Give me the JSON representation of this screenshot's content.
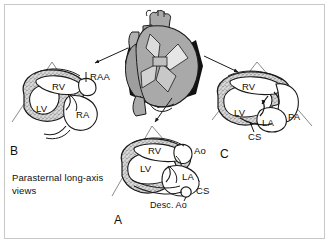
{
  "figure": {
    "title": "Parasternal long-axis views",
    "caption": "Parasternal long-axis views",
    "caption_line1": "Parasternal long-axis",
    "caption_line2": "views",
    "colors": {
      "background": "#ffffff",
      "frame": "#c9c9c9",
      "ink": "#0f0f0f",
      "myocardium_fill": "#b5b5b5",
      "sector_line": "#8a8a8a",
      "plane_black": "#111111",
      "heart_gray": "#a9a9a9",
      "heart_gray_dark": "#8f8f8f"
    }
  },
  "central_heart": {
    "name": "three-dimensional heart with imaging planes",
    "description": "Anterior view of the heart with three black fan-shaped tomographic planes transecting it",
    "planes": [
      {
        "name": "plane-to-panel-B",
        "target": "B"
      },
      {
        "name": "plane-to-panel-A",
        "target": "A"
      },
      {
        "name": "plane-to-panel-C",
        "target": "C"
      }
    ]
  },
  "arrows": [
    {
      "name": "arrow-to-panel-B",
      "from": "central heart",
      "to": "panel B sector"
    },
    {
      "name": "arrow-to-panel-A",
      "from": "central heart",
      "to": "panel A sector"
    },
    {
      "name": "arrow-to-panel-C",
      "from": "central heart",
      "to": "panel C sector"
    }
  ],
  "panels": [
    {
      "id": "A",
      "letter": "A",
      "name": "panel-a-standard-parasternal-long-axis",
      "labels": [
        {
          "key": "rv",
          "text": "RV",
          "kind": "chamber"
        },
        {
          "key": "lv",
          "text": "LV",
          "kind": "chamber"
        },
        {
          "key": "la",
          "text": "LA",
          "kind": "chamber"
        },
        {
          "key": "ao",
          "text": "Ao",
          "kind": "vessel"
        },
        {
          "key": "cs",
          "text": "CS",
          "kind": "vessel"
        },
        {
          "key": "desc_ao",
          "text": "Desc. Ao",
          "kind": "vessel"
        }
      ]
    },
    {
      "id": "B",
      "letter": "B",
      "name": "panel-b-right-ventricular-inflow-view",
      "labels": [
        {
          "key": "rv",
          "text": "RV",
          "kind": "chamber"
        },
        {
          "key": "lv",
          "text": "LV",
          "kind": "chamber"
        },
        {
          "key": "ra",
          "text": "RA",
          "kind": "chamber"
        },
        {
          "key": "raa",
          "text": "RAA",
          "kind": "vessel"
        }
      ]
    },
    {
      "id": "C",
      "letter": "C",
      "name": "panel-c-right-ventricular-outflow-view",
      "labels": [
        {
          "key": "rv",
          "text": "RV",
          "kind": "chamber"
        },
        {
          "key": "lv",
          "text": "LV",
          "kind": "chamber"
        },
        {
          "key": "la",
          "text": "LA",
          "kind": "chamber"
        },
        {
          "key": "pa",
          "text": "PA",
          "kind": "vessel"
        },
        {
          "key": "cs",
          "text": "CS",
          "kind": "vessel"
        }
      ]
    }
  ],
  "abbreviations": {
    "RV": "right ventricle",
    "LV": "left ventricle",
    "RA": "right atrium",
    "LA": "left atrium",
    "RAA": "right atrial appendage",
    "Ao": "aorta",
    "PA": "pulmonary artery",
    "CS": "coronary sinus",
    "Desc. Ao": "descending aorta"
  },
  "labels_flat": {
    "a_rv": "RV",
    "a_lv": "LV",
    "a_la": "LA",
    "a_ao": "Ao",
    "a_cs": "CS",
    "a_desc_ao": "Desc. Ao",
    "a_letter": "A",
    "b_rv": "RV",
    "b_lv": "LV",
    "b_ra": "RA",
    "b_raa": "RAA",
    "b_letter": "B",
    "c_rv": "RV",
    "c_lv": "LV",
    "c_la": "LA",
    "c_pa": "PA",
    "c_cs": "CS",
    "c_letter": "C"
  }
}
